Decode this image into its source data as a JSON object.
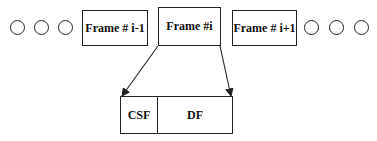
{
  "diagram": {
    "left_ellipsis_dots": 3,
    "right_ellipsis_dots": 3,
    "frames": [
      {
        "label": "Frame # i-1"
      },
      {
        "label": "Frame #i"
      },
      {
        "label": "Frame # i+1"
      }
    ],
    "expanded_frame": {
      "parts": [
        {
          "label": "CSF"
        },
        {
          "label": "DF"
        }
      ]
    },
    "colors": {
      "stroke": "#222222",
      "background": "#ffffff"
    }
  }
}
